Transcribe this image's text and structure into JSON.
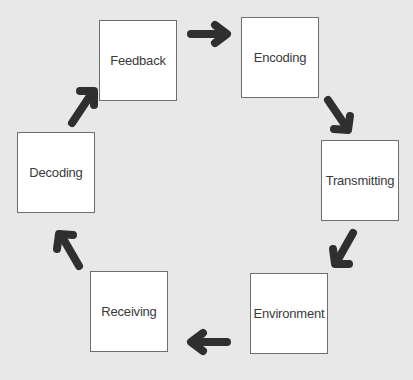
{
  "diagram": {
    "type": "cycle",
    "background_color": "#e8e8e8",
    "arrow_color": "#2f2f2f",
    "nodes": [
      {
        "label": "Feedback"
      },
      {
        "label": "Encoding"
      },
      {
        "label": "Transmitting"
      },
      {
        "label": "Environment"
      },
      {
        "label": "Receiving"
      },
      {
        "label": "Decoding"
      }
    ],
    "edges": [
      {
        "from": "Feedback",
        "to": "Encoding",
        "icon": "arrow-right-icon"
      },
      {
        "from": "Encoding",
        "to": "Transmitting",
        "icon": "arrow-down-right-icon"
      },
      {
        "from": "Transmitting",
        "to": "Environment",
        "icon": "arrow-down-left-icon"
      },
      {
        "from": "Environment",
        "to": "Receiving",
        "icon": "arrow-left-icon"
      },
      {
        "from": "Receiving",
        "to": "Decoding",
        "icon": "arrow-up-left-icon"
      },
      {
        "from": "Decoding",
        "to": "Feedback",
        "icon": "arrow-up-right-icon"
      }
    ]
  }
}
